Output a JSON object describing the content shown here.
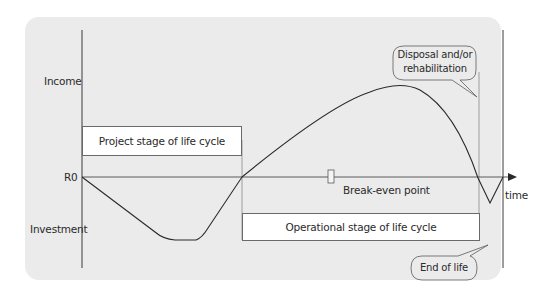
{
  "diagram": {
    "axis_labels": {
      "income": "Income",
      "origin": "R0",
      "investment": "Investment",
      "time": "time"
    },
    "stages": {
      "project": "Project stage of life cycle",
      "operational": "Operational stage of life cycle"
    },
    "annotations": {
      "break_even": "Break-even point",
      "disposal_line1": "Disposal and/or",
      "disposal_line2": "rehabilitation",
      "end_of_life": "End of life"
    },
    "colors": {
      "panel_background": "#ebebeb",
      "line": "#2a2a2a",
      "box_fill": "#ffffff",
      "box_border": "#6a6a6a"
    }
  }
}
